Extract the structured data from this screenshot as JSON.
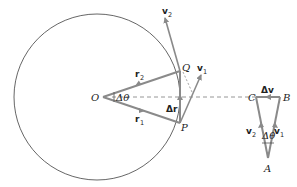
{
  "diagram": {
    "colors": {
      "vector": "#8a8a8a",
      "circle": "#555555",
      "text": "#222222"
    },
    "circle": {
      "cx": 97,
      "cy": 97,
      "r": 83
    },
    "points": {
      "O": {
        "label": "O",
        "x": 103,
        "y": 97
      },
      "Q": {
        "label": "Q",
        "x": 180,
        "y": 71
      },
      "P": {
        "label": "P",
        "x": 180,
        "y": 123
      },
      "C": {
        "label": "C",
        "x": 256,
        "y": 97
      },
      "B": {
        "label": "B",
        "x": 280,
        "y": 97
      },
      "A": {
        "label": "A",
        "x": 268,
        "y": 158
      }
    },
    "vectors": {
      "r1": {
        "label": "r",
        "sub": "1"
      },
      "r2": {
        "label": "r",
        "sub": "2"
      },
      "v1": {
        "label": "v",
        "sub": "1"
      },
      "v2": {
        "label": "v",
        "sub": "2"
      },
      "dr": {
        "label": "Δr"
      },
      "dv": {
        "label": "Δv"
      }
    },
    "angles": {
      "at_O": {
        "label": "Δθ"
      },
      "at_A": {
        "label": "Δθ"
      }
    }
  }
}
